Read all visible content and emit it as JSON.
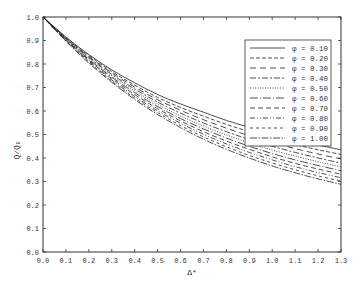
{
  "chart_data": {
    "type": "line",
    "title": "",
    "xlabel": "Δ*",
    "ylabel": "Q/Q₀",
    "xlim": [
      0.0,
      1.3
    ],
    "ylim": [
      0.0,
      1.0
    ],
    "grid": false,
    "legend_position": "upper right",
    "x_ticks": [
      "0.0",
      "0.1",
      "0.2",
      "0.3",
      "0.4",
      "0.5",
      "0.6",
      "0.7",
      "0.8",
      "0.9",
      "1.0",
      "1.1",
      "1.2",
      "1.3"
    ],
    "y_ticks": [
      "0.0",
      "0.1",
      "0.2",
      "0.3",
      "0.4",
      "0.5",
      "0.6",
      "0.7",
      "0.8",
      "0.9",
      "1.0"
    ],
    "x": [
      0.0,
      0.1,
      0.2,
      0.3,
      0.4,
      0.5,
      0.6,
      0.7,
      0.8,
      0.9,
      1.0,
      1.1,
      1.2,
      1.3
    ],
    "series": [
      {
        "name": "φ = 0.10",
        "dash": "",
        "values": [
          1.0,
          0.915,
          0.84,
          0.775,
          0.72,
          0.67,
          0.63,
          0.595,
          0.56,
          0.53,
          0.5,
          0.475,
          0.455,
          0.435
        ]
      },
      {
        "name": "φ = 0.20",
        "dash": "4,2",
        "values": [
          1.0,
          0.913,
          0.836,
          0.768,
          0.71,
          0.658,
          0.615,
          0.578,
          0.543,
          0.512,
          0.482,
          0.457,
          0.435,
          0.415
        ]
      },
      {
        "name": "φ = 0.30",
        "dash": "6,4",
        "values": [
          1.0,
          0.911,
          0.832,
          0.762,
          0.702,
          0.648,
          0.603,
          0.563,
          0.527,
          0.495,
          0.466,
          0.44,
          0.417,
          0.396
        ]
      },
      {
        "name": "φ = 0.40",
        "dash": "6,2,2,2",
        "values": [
          1.0,
          0.909,
          0.828,
          0.756,
          0.694,
          0.638,
          0.591,
          0.549,
          0.512,
          0.479,
          0.45,
          0.424,
          0.4,
          0.378
        ]
      },
      {
        "name": "φ = 0.50",
        "dash": "1,1.5",
        "values": [
          1.0,
          0.907,
          0.824,
          0.75,
          0.686,
          0.628,
          0.579,
          0.536,
          0.498,
          0.464,
          0.434,
          0.408,
          0.384,
          0.362
        ]
      },
      {
        "name": "φ = 0.60",
        "dash": "8,2,1,2",
        "values": [
          1.0,
          0.905,
          0.82,
          0.744,
          0.678,
          0.619,
          0.568,
          0.524,
          0.485,
          0.45,
          0.419,
          0.392,
          0.368,
          0.346
        ]
      },
      {
        "name": "φ = 0.70",
        "dash": "5,3",
        "values": [
          1.0,
          0.903,
          0.816,
          0.738,
          0.67,
          0.61,
          0.558,
          0.512,
          0.472,
          0.437,
          0.405,
          0.377,
          0.353,
          0.331
        ]
      },
      {
        "name": "φ = 0.80",
        "dash": "5,2,1,2,1,2",
        "values": [
          1.0,
          0.901,
          0.812,
          0.732,
          0.662,
          0.601,
          0.548,
          0.501,
          0.46,
          0.424,
          0.392,
          0.363,
          0.338,
          0.316
        ]
      },
      {
        "name": "φ = 0.90",
        "dash": "3,3",
        "values": [
          1.0,
          0.899,
          0.808,
          0.727,
          0.655,
          0.593,
          0.538,
          0.49,
          0.448,
          0.411,
          0.379,
          0.35,
          0.324,
          0.302
        ]
      },
      {
        "name": "φ = 1.00",
        "dash": "7,1.5,1.5,1.5",
        "values": [
          1.0,
          0.897,
          0.804,
          0.722,
          0.649,
          0.585,
          0.529,
          0.48,
          0.437,
          0.4,
          0.366,
          0.337,
          0.311,
          0.288
        ]
      }
    ]
  }
}
